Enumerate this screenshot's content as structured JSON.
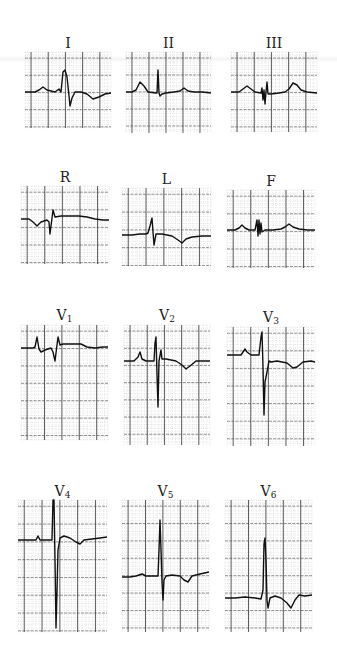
{
  "figure": {
    "leads": [
      {
        "id": "I",
        "label": "I",
        "sub": "",
        "box": [
          25,
          52,
          86,
          76
        ],
        "label_y": 36,
        "baseline": 0.45,
        "trace": "M0,40 L10,40 L14,38 L18,35 L22,38 L30,40 L34,37 L36,40 L38,20 L40,18 L42,25 L44,44 L45,54 L47,46 L50,40 L56,40 L62,42 L68,47 L74,45 L80,42 L86,41"
      },
      {
        "id": "II",
        "label": "II",
        "sub": "",
        "box": [
          126,
          52,
          85,
          81
        ],
        "label_y": 36,
        "baseline": 0.5,
        "trace": "M0,40 L6,40 L10,38 L14,30 L18,34 L22,40 L30,41 L31,41 L32,18 L33,41 L34,44 L36,42 L40,41 L48,40 L54,39 L58,36 L62,39 L68,40 L76,40 L85,41"
      },
      {
        "id": "III",
        "label": "III",
        "sub": "",
        "box": [
          231,
          52,
          86,
          80
        ],
        "label_y": 36,
        "baseline": 0.5,
        "trace": "M0,40 L8,40 L12,37 L16,34 L20,37 L24,40 L30,41 L31,36 L32,48 L33,38 L34,52 L35,40 L36,30 L37,42 L40,42 L48,41 L54,40 L58,37 L62,31 L66,33 L70,38 L76,40 L86,41"
      },
      {
        "id": "R",
        "label": "R",
        "sub": "",
        "box": [
          21,
          186,
          88,
          78
        ],
        "label_y": 170,
        "baseline": 0.45,
        "trace": "M0,33 L8,33 L12,36 L16,40 L20,36 L26,34 L28,36 L29,48 L30,40 L32,24 L34,31 L40,30 L50,30 L58,30 L66,31 L74,33 L82,34 L88,34"
      },
      {
        "id": "L",
        "label": "L",
        "sub": "",
        "box": [
          122,
          188,
          89,
          78
        ],
        "label_y": 172,
        "baseline": 0.6,
        "trace": "M0,47 L10,47 L18,46 L24,46 L26,45 L28,38 L30,30 L31,44 L32,57 L34,46 L40,46 L50,48 L56,52 L60,55 L64,51 L70,49 L80,48 L89,48"
      },
      {
        "id": "F",
        "label": "F",
        "sub": "",
        "box": [
          227,
          190,
          88,
          78
        ],
        "label_y": 174,
        "baseline": 0.55,
        "trace": "M0,40 L8,40 L12,38 L15,35 L18,38 L22,40 L28,40 L30,30 L31,46 L32,30 L33,44 L34,33 L35,42 L38,40 L46,40 L54,39 L58,37 L62,34 L66,37 L72,39 L80,40 L88,40"
      },
      {
        "id": "V1",
        "label": "V",
        "sub": "1",
        "box": [
          21,
          325,
          87,
          115
        ],
        "label_y": 308,
        "baseline": 0.2,
        "trace": "M0,23 L12,23 L14,22 L16,12 L18,24 L20,27 L24,25 L30,23 L32,27 L34,36 L35,28 L37,12 L39,20 L42,19 L52,19 L60,19 L66,22 L74,23 L82,22 L87,22"
      },
      {
        "id": "V2",
        "label": "V",
        "sub": "2",
        "box": [
          124,
          325,
          86,
          120
        ],
        "label_y": 308,
        "baseline": 0.3,
        "trace": "M0,36 L10,36 L14,32 L16,27 L18,34 L22,36 L30,36 L31,18 L32,12 L33,50 L34,82 L35,36 L37,25 L38,34 L42,34 L52,36 L58,40 L62,44 L66,41 L72,36 L86,36"
      },
      {
        "id": "V3",
        "label": "V",
        "sub": "3",
        "box": [
          227,
          327,
          88,
          119
        ],
        "label_y": 310,
        "baseline": 0.25,
        "trace": "M0,28 L14,28 L18,22 L20,25 L24,28 L32,28 L34,10 L35,5 L36,40 L37,88 L38,55 L40,45 L42,34 L44,35 L50,34 L60,36 L66,41 L70,40 L76,35 L84,34 L88,35"
      },
      {
        "id": "V4",
        "label": "V",
        "sub": "4",
        "box": [
          18,
          500,
          89,
          132
        ],
        "label_y": 484,
        "baseline": 0.3,
        "trace": "M0,40 L10,40 L18,40 L20,36 L22,40 L30,40 L34,40 L35,0 L36,0 L37,60 L38,128 L39,90 L40,50 L42,38 L46,36 L52,38 L58,42 L62,44 L66,40 L74,39 L82,38 L89,37"
      },
      {
        "id": "V5",
        "label": "V",
        "sub": "5",
        "box": [
          122,
          500,
          87,
          132
        ],
        "label_y": 484,
        "baseline": 0.6,
        "trace": "M0,77 L8,77 L14,76 L20,74 L24,76 L32,76 L36,76 L37,50 L38,20 L39,50 L40,82 L41,100 L42,80 L44,76 L50,75 L58,76 L62,80 L66,82 L70,76 L78,74 L87,72"
      },
      {
        "id": "V6",
        "label": "V",
        "sub": "6",
        "box": [
          225,
          500,
          87,
          132
        ],
        "label_y": 484,
        "baseline": 0.75,
        "trace": "M0,98 L10,98 L20,97 L30,98 L36,99 L38,90 L39,44 L40,38 L41,60 L42,100 L43,108 L45,98 L50,96 L56,98 L62,103 L66,108 L70,100 L74,95 L80,96 L87,95"
      }
    ]
  },
  "colors": {
    "grid_major": "#4a4a4a",
    "grid_minor": "#9a9a9a",
    "trace": "#111111",
    "label": "#222222"
  }
}
